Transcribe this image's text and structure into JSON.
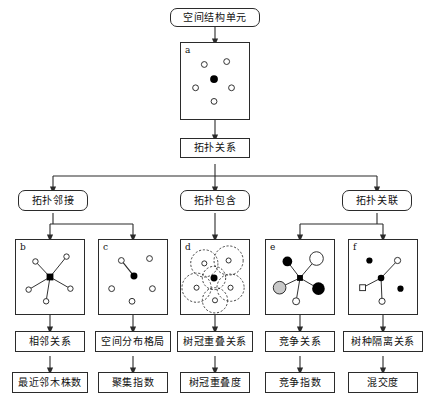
{
  "diagram": {
    "title_text": "空间结构单元",
    "root": {
      "label": "空间结构单元"
    },
    "level2": {
      "label": "拓扑关系"
    },
    "level3": [
      {
        "label": "拓扑邻接"
      },
      {
        "label": "拓扑包含"
      },
      {
        "label": "拓扑关联"
      }
    ],
    "panels": [
      {
        "id": "a",
        "label": "a",
        "caption": ""
      },
      {
        "id": "b",
        "label": "b",
        "caption": ""
      },
      {
        "id": "c",
        "label": "c",
        "caption": ""
      },
      {
        "id": "d",
        "label": "d",
        "caption": ""
      },
      {
        "id": "e",
        "label": "e",
        "caption": ""
      },
      {
        "id": "f",
        "label": "f",
        "caption": ""
      }
    ],
    "relations": [
      {
        "label": "相邻关系"
      },
      {
        "label": "空间分布格局"
      },
      {
        "label": "树冠重叠关系"
      },
      {
        "label": "竞争关系"
      },
      {
        "label": "树种隔离关系"
      }
    ],
    "indices": [
      {
        "label": "最近邻木株数"
      },
      {
        "label": "聚集指数"
      },
      {
        "label": "树冠重叠度"
      },
      {
        "label": "竞争指数"
      },
      {
        "label": "混交度"
      }
    ],
    "colors": {
      "stroke": "#2b2b2b",
      "fill": "#ffffff",
      "node_dark": "#000000",
      "node_gray": "#c8c8c8",
      "background": "#ffffff"
    }
  }
}
